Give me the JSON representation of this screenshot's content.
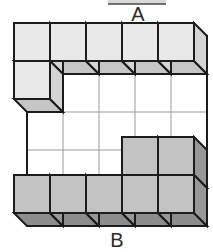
{
  "page": {
    "background": "#ffffff",
    "width": 213,
    "height": 252
  },
  "artifact_bar": {
    "x": 108,
    "y": 0,
    "width": 58,
    "height": 4,
    "fill": "#d9d9d9",
    "edge_color": "#4a4a4a"
  },
  "diagram": {
    "label_top": "A",
    "label_bottom": "B",
    "label_color": "#2b2b2b",
    "label_font_size": 20,
    "label_top_pos": {
      "x": 138,
      "y": 21
    },
    "label_bottom_pos": {
      "x": 117,
      "y": 247
    },
    "grid": {
      "cols": 5,
      "rows": 5,
      "cell_w": 36,
      "cell_h": 38,
      "origin_x": 14,
      "origin_y": 23,
      "depth_dx": 13,
      "depth_dy": 13
    },
    "back_face": {
      "fill": "#ffffff",
      "grid_line_color": "#9b9b9b",
      "grid_line_width": 1,
      "outline_color": "#1c1c1c",
      "outline_width": 2
    },
    "shades": {
      "light": {
        "front": "#e8e8e8",
        "bottom": "#c6c6c6",
        "right": "#d4d4d4"
      },
      "dark": {
        "front": "#c3c3c3",
        "bottom": "#8d8d8d",
        "right": "#989898"
      }
    },
    "outline_color": "#1c1c1c",
    "outline_width": 2,
    "cubes": [
      {
        "col": 0,
        "row": 0,
        "shade": "light"
      },
      {
        "col": 1,
        "row": 0,
        "shade": "light"
      },
      {
        "col": 2,
        "row": 0,
        "shade": "light"
      },
      {
        "col": 3,
        "row": 0,
        "shade": "light"
      },
      {
        "col": 4,
        "row": 0,
        "shade": "light"
      },
      {
        "col": 0,
        "row": 1,
        "shade": "light"
      },
      {
        "col": 3,
        "row": 3,
        "shade": "dark"
      },
      {
        "col": 4,
        "row": 3,
        "shade": "dark"
      },
      {
        "col": 0,
        "row": 4,
        "shade": "dark"
      },
      {
        "col": 1,
        "row": 4,
        "shade": "dark"
      },
      {
        "col": 2,
        "row": 4,
        "shade": "dark"
      },
      {
        "col": 3,
        "row": 4,
        "shade": "dark"
      },
      {
        "col": 4,
        "row": 4,
        "shade": "dark"
      }
    ]
  }
}
